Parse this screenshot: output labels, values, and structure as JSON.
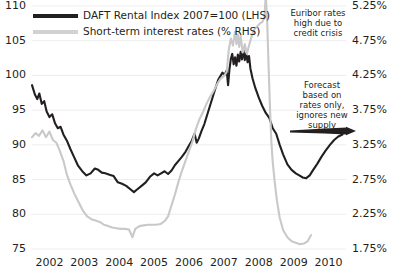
{
  "chart_data": {
    "type": "line",
    "title": "",
    "xlabel": "",
    "ylabel": "",
    "grid": true,
    "legend_position": "top-left",
    "x_tick_labels": [
      "2002",
      "2003",
      "2004",
      "2005",
      "2006",
      "2007",
      "2008",
      "2009",
      "2010"
    ],
    "y_left": {
      "label": "DAFT Rental Index 2007=100",
      "ticks": [
        75,
        80,
        85,
        90,
        95,
        100,
        105,
        110
      ],
      "ylim": [
        75,
        110
      ]
    },
    "y_right": {
      "label": "Short-term interest rates (%)",
      "ticks": [
        "1.75%",
        "2.25%",
        "2.75%",
        "3.25%",
        "3.75%",
        "4.25%",
        "4.75%",
        "5.25%"
      ],
      "ylim": [
        1.75,
        5.25
      ]
    },
    "series": [
      {
        "name": "DAFT Rental Index 2007=100 (LHS)",
        "axis": "left",
        "color": "#231f20",
        "width": 2.1,
        "points": [
          [
            2002.0,
            98.6
          ],
          [
            2002.08,
            97.3
          ],
          [
            2002.15,
            96.6
          ],
          [
            2002.21,
            97.4
          ],
          [
            2002.28,
            95.9
          ],
          [
            2002.35,
            96.3
          ],
          [
            2002.42,
            94.8
          ],
          [
            2002.5,
            94.0
          ],
          [
            2002.58,
            94.4
          ],
          [
            2002.66,
            93.1
          ],
          [
            2002.74,
            92.4
          ],
          [
            2002.82,
            92.6
          ],
          [
            2002.9,
            91.5
          ],
          [
            2003.0,
            90.6
          ],
          [
            2003.1,
            89.4
          ],
          [
            2003.2,
            88.3
          ],
          [
            2003.32,
            87.0
          ],
          [
            2003.44,
            86.2
          ],
          [
            2003.56,
            85.6
          ],
          [
            2003.68,
            85.9
          ],
          [
            2003.8,
            86.6
          ],
          [
            2003.9,
            86.4
          ],
          [
            2004.0,
            86.0
          ],
          [
            2004.1,
            85.9
          ],
          [
            2004.22,
            85.7
          ],
          [
            2004.34,
            85.5
          ],
          [
            2004.46,
            84.6
          ],
          [
            2004.58,
            84.4
          ],
          [
            2004.7,
            84.1
          ],
          [
            2004.82,
            83.6
          ],
          [
            2004.92,
            83.2
          ],
          [
            2005.02,
            83.6
          ],
          [
            2005.14,
            84.1
          ],
          [
            2005.26,
            84.6
          ],
          [
            2005.38,
            85.4
          ],
          [
            2005.5,
            85.9
          ],
          [
            2005.6,
            85.6
          ],
          [
            2005.7,
            85.9
          ],
          [
            2005.8,
            86.2
          ],
          [
            2005.9,
            85.8
          ],
          [
            2006.0,
            86.3
          ],
          [
            2006.1,
            87.1
          ],
          [
            2006.2,
            87.7
          ],
          [
            2006.3,
            88.3
          ],
          [
            2006.4,
            89.0
          ],
          [
            2006.5,
            89.9
          ],
          [
            2006.58,
            90.6
          ],
          [
            2006.66,
            91.6
          ],
          [
            2006.72,
            90.3
          ],
          [
            2006.78,
            90.9
          ],
          [
            2006.86,
            92.0
          ],
          [
            2006.94,
            93.0
          ],
          [
            2007.02,
            94.3
          ],
          [
            2007.1,
            95.6
          ],
          [
            2007.18,
            96.9
          ],
          [
            2007.26,
            98.2
          ],
          [
            2007.34,
            99.4
          ],
          [
            2007.4,
            99.9
          ],
          [
            2007.46,
            100.4
          ],
          [
            2007.52,
            100.1
          ],
          [
            2007.58,
            100.7
          ],
          [
            2007.62,
            98.6
          ],
          [
            2007.66,
            100.9
          ],
          [
            2007.7,
            102.4
          ],
          [
            2007.74,
            103.1
          ],
          [
            2007.78,
            101.6
          ],
          [
            2007.82,
            102.6
          ],
          [
            2007.86,
            101.4
          ],
          [
            2007.9,
            103.0
          ],
          [
            2007.94,
            102.0
          ],
          [
            2007.98,
            103.4
          ],
          [
            2008.02,
            102.3
          ],
          [
            2008.06,
            103.6
          ],
          [
            2008.1,
            102.2
          ],
          [
            2008.14,
            103.2
          ],
          [
            2008.18,
            101.9
          ],
          [
            2008.22,
            102.8
          ],
          [
            2008.26,
            101.0
          ],
          [
            2008.32,
            99.6
          ],
          [
            2008.4,
            98.2
          ],
          [
            2008.5,
            96.8
          ],
          [
            2008.6,
            95.6
          ],
          [
            2008.7,
            94.6
          ],
          [
            2008.8,
            93.9
          ],
          [
            2008.9,
            92.4
          ],
          [
            2009.0,
            91.6
          ],
          [
            2009.1,
            90.0
          ],
          [
            2009.2,
            88.6
          ],
          [
            2009.32,
            87.2
          ],
          [
            2009.44,
            86.4
          ],
          [
            2009.56,
            85.9
          ],
          [
            2009.66,
            85.6
          ],
          [
            2009.76,
            85.3
          ],
          [
            2009.86,
            85.2
          ],
          [
            2009.96,
            85.6
          ],
          [
            2010.06,
            86.4
          ],
          [
            2010.18,
            87.3
          ],
          [
            2010.3,
            88.3
          ],
          [
            2010.42,
            89.2
          ],
          [
            2010.54,
            90.0
          ],
          [
            2010.66,
            90.7
          ],
          [
            2010.78,
            91.2
          ],
          [
            2010.9,
            91.5
          ]
        ]
      },
      {
        "name": "Short-term interest rates (% RHS)",
        "axis": "right",
        "color": "#c9c9c9",
        "width": 2.1,
        "points": [
          [
            2002.0,
            3.36
          ],
          [
            2002.1,
            3.42
          ],
          [
            2002.2,
            3.38
          ],
          [
            2002.3,
            3.46
          ],
          [
            2002.4,
            3.36
          ],
          [
            2002.5,
            3.44
          ],
          [
            2002.6,
            3.32
          ],
          [
            2002.7,
            3.28
          ],
          [
            2002.8,
            3.16
          ],
          [
            2002.9,
            3.02
          ],
          [
            2003.0,
            2.82
          ],
          [
            2003.1,
            2.68
          ],
          [
            2003.22,
            2.54
          ],
          [
            2003.34,
            2.42
          ],
          [
            2003.46,
            2.3
          ],
          [
            2003.58,
            2.22
          ],
          [
            2003.7,
            2.18
          ],
          [
            2003.82,
            2.16
          ],
          [
            2003.94,
            2.14
          ],
          [
            2004.06,
            2.1
          ],
          [
            2004.18,
            2.08
          ],
          [
            2004.3,
            2.06
          ],
          [
            2004.42,
            2.05
          ],
          [
            2004.54,
            2.04
          ],
          [
            2004.66,
            2.04
          ],
          [
            2004.78,
            2.03
          ],
          [
            2004.88,
            1.92
          ],
          [
            2004.96,
            2.04
          ],
          [
            2005.08,
            2.08
          ],
          [
            2005.2,
            2.09
          ],
          [
            2005.32,
            2.1
          ],
          [
            2005.44,
            2.1
          ],
          [
            2005.56,
            2.1
          ],
          [
            2005.68,
            2.11
          ],
          [
            2005.8,
            2.15
          ],
          [
            2005.9,
            2.22
          ],
          [
            2006.0,
            2.38
          ],
          [
            2006.1,
            2.54
          ],
          [
            2006.2,
            2.72
          ],
          [
            2006.3,
            2.88
          ],
          [
            2006.4,
            3.02
          ],
          [
            2006.5,
            3.16
          ],
          [
            2006.6,
            3.3
          ],
          [
            2006.7,
            3.48
          ],
          [
            2006.8,
            3.62
          ],
          [
            2006.9,
            3.72
          ],
          [
            2007.0,
            3.84
          ],
          [
            2007.1,
            3.94
          ],
          [
            2007.2,
            4.02
          ],
          [
            2007.3,
            4.12
          ],
          [
            2007.4,
            4.2
          ],
          [
            2007.5,
            4.24
          ],
          [
            2007.58,
            4.3
          ],
          [
            2007.64,
            4.62
          ],
          [
            2007.7,
            4.78
          ],
          [
            2007.76,
            4.68
          ],
          [
            2007.82,
            4.88
          ],
          [
            2007.86,
            4.7
          ],
          [
            2007.9,
            4.84
          ],
          [
            2007.94,
            4.66
          ],
          [
            2007.98,
            4.82
          ],
          [
            2008.04,
            4.58
          ],
          [
            2008.1,
            4.7
          ],
          [
            2008.16,
            4.56
          ],
          [
            2008.22,
            4.68
          ],
          [
            2008.3,
            4.82
          ],
          [
            2008.38,
            4.92
          ],
          [
            2008.46,
            4.96
          ],
          [
            2008.54,
            5.0
          ],
          [
            2008.6,
            5.02
          ],
          [
            2008.66,
            5.08
          ],
          [
            2008.7,
            5.4
          ],
          [
            2008.74,
            5.05
          ],
          [
            2008.78,
            4.4
          ],
          [
            2008.82,
            3.8
          ],
          [
            2008.86,
            3.3
          ],
          [
            2008.9,
            3.0
          ],
          [
            2008.96,
            2.7
          ],
          [
            2009.02,
            2.45
          ],
          [
            2009.1,
            2.2
          ],
          [
            2009.2,
            2.02
          ],
          [
            2009.32,
            1.92
          ],
          [
            2009.44,
            1.86
          ],
          [
            2009.56,
            1.84
          ],
          [
            2009.68,
            1.82
          ],
          [
            2009.8,
            1.83
          ],
          [
            2009.9,
            1.86
          ],
          [
            2010.0,
            1.95
          ]
        ]
      }
    ],
    "annotations": [
      {
        "name": "euribor-annotation",
        "lines": [
          "Euribor rates",
          "high due to",
          "credit crisis"
        ],
        "x_px": 318,
        "y_px": 8
      },
      {
        "name": "forecast-annotation",
        "lines": [
          "Forecast",
          "based on",
          "rates only,",
          "ignores new",
          "supply"
        ],
        "x_px": 322,
        "y_px": 80
      }
    ],
    "forecast_arrow": {
      "name": "forecast-arrow",
      "x1_px": 290,
      "x2_px": 356,
      "y_px": 131,
      "color": "#231f20"
    }
  },
  "legend": {
    "items": [
      {
        "label": "DAFT Rental Index 2007=100 (LHS)",
        "color": "#231f20",
        "style": "thick-line"
      },
      {
        "label": "Short-term interest rates (% RHS)",
        "color": "#d2d2d2",
        "style": "thick-line"
      }
    ]
  },
  "colors": {
    "rental_index": "#231f20",
    "interest_rates": "#c9c9c9",
    "grid": "#ededed",
    "text": "#231f20",
    "background": "#ffffff"
  }
}
